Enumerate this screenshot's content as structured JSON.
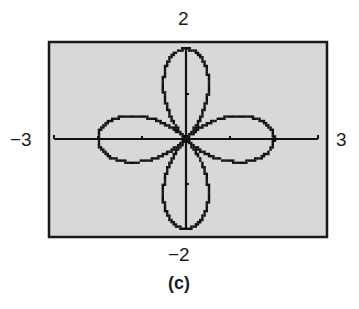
{
  "figure": {
    "caption": "(c)",
    "window_labels": {
      "ymax": "2",
      "ymin": "−2",
      "xmin": "−3",
      "xmax": "3"
    },
    "colors": {
      "screen_background": "#d8d8d8",
      "border": "#1a1a1a",
      "curve": "#111111",
      "axes": "#111111",
      "page_background": "#ffffff"
    }
  },
  "chart_data": {
    "type": "line",
    "title": "",
    "subtitle": "Graphing-calculator screen: four-petal rose curve (polar graph)",
    "xlabel": "",
    "ylabel": "",
    "xlim": [
      -3,
      3
    ],
    "ylim": [
      -2,
      2
    ],
    "x_tick_step": 1,
    "y_tick_step": 1,
    "grid": false,
    "legend": null,
    "series": [
      {
        "name": "rose curve",
        "form": "polar",
        "description": "4-petal rose centered at origin, petals along the positive/negative x and y axes, petal length 2",
        "petal_tips": [
          [
            2,
            0
          ],
          [
            0,
            2
          ],
          [
            -2,
            0
          ],
          [
            0,
            -2
          ]
        ],
        "petal_half_width": 0.52
      }
    ],
    "annotations": [
      "(c)"
    ]
  }
}
